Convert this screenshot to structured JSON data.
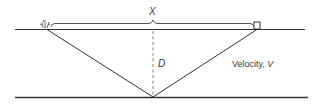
{
  "diagram": {
    "type": "seismic-reflection-geometry",
    "labels": {
      "offset": "X",
      "depth": "D",
      "velocity_prefix": "Velocity, ",
      "velocity_var": "V"
    },
    "elements": {
      "surface": "ground surface line",
      "reflector": "reflecting interface line",
      "source": "shot point (explosion symbol)",
      "receiver": "geophone (square symbol)",
      "raypath_down": "incident ray from source to reflector midpoint",
      "raypath_up": "reflected ray from reflector midpoint to receiver",
      "depth_line": "dashed vertical line from surface to reflection point",
      "offset_brace": "brace spanning source to receiver distance"
    },
    "colors": {
      "line": "#333333",
      "dashed": "#777777",
      "text": "#3a3a3a"
    }
  }
}
